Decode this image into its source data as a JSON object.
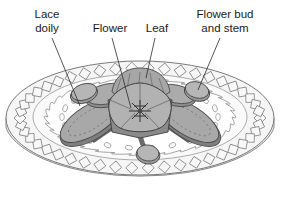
{
  "figure": {
    "background_color": "#ffffff",
    "labels": [
      {
        "id": "lace-doily",
        "name": "Lace doily",
        "lines": [
          "Lace",
          "doily"
        ],
        "text_x": 47,
        "text_y": 18,
        "leader": {
          "x1": 52,
          "y1": 38,
          "x2": 80,
          "y2": 106
        }
      },
      {
        "id": "flower",
        "name": "Flower",
        "lines": [
          "Flower"
        ],
        "text_x": 110,
        "text_y": 32,
        "leader": {
          "x1": 112,
          "y1": 38,
          "x2": 131,
          "y2": 108
        }
      },
      {
        "id": "leaf",
        "name": "Leaf",
        "lines": [
          "Leaf"
        ],
        "text_x": 157,
        "text_y": 32,
        "leader": {
          "x1": 155,
          "y1": 38,
          "x2": 146,
          "y2": 78
        }
      },
      {
        "id": "flower-bud-and-stem",
        "name": "Flower bud and stem",
        "lines": [
          "Flower bud",
          "and stem"
        ],
        "text_x": 225,
        "text_y": 18,
        "leader": {
          "x1": 220,
          "y1": 38,
          "x2": 198,
          "y2": 90
        }
      }
    ],
    "colors": {
      "outline": "#4a4a4a",
      "text": "#1a1a1a",
      "plate_fill": "#f2f2f2",
      "plate_rim_fill": "#fbfbfb",
      "doily_fill": "#fdfdfd",
      "petal_fill": "#a9a9a9",
      "petal_shadow": "#7d7d7d",
      "leaf_fill": "#9e9e9e",
      "center_fill": "#b5b5b5",
      "stem_fill": "#6e6e6e",
      "bud_fill": "#b0b0b0",
      "border_diamond_fill": "#f7f7f7"
    },
    "elements": {
      "plate": "oval-plate",
      "plate_border_pattern": "tilted-square-chain",
      "doily": "scalloped-lace-doily-with-oval-eyelets",
      "arrangement": "five-petal-flower-with-leaves-buds-and-stems"
    },
    "counts": {
      "leaves": 4,
      "buds": 3,
      "petals": 5
    }
  }
}
